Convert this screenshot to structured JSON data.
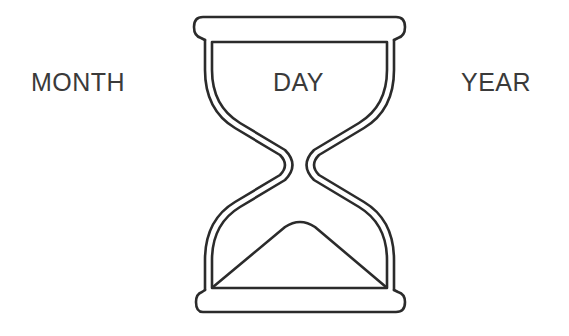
{
  "labels": {
    "month": "MONTH",
    "day": "DAY",
    "year": "YEAR"
  },
  "icon": {
    "name": "hourglass-icon",
    "stroke_color": "#2b2b2b"
  }
}
